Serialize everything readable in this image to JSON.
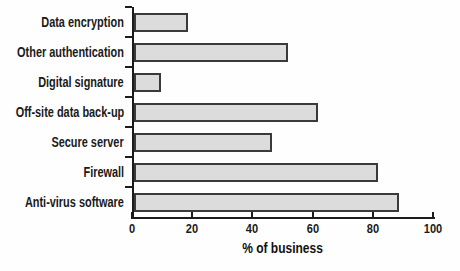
{
  "chart_data": {
    "type": "bar",
    "orientation": "horizontal",
    "title": "",
    "xlabel": "% of business",
    "ylabel": "",
    "categories": [
      "Data encryption",
      "Other authentication",
      "Digital signature",
      "Off-site data back-up",
      "Secure server",
      "Firewall",
      "Anti-virus software"
    ],
    "values": [
      18,
      51,
      9,
      61,
      46,
      81,
      88
    ],
    "xlim": [
      0,
      100
    ],
    "x_ticks": [
      0,
      20,
      40,
      60,
      80,
      100
    ],
    "grid": "off",
    "legend": "none",
    "bar_fill_color": "#dcdcdc",
    "bar_border_color": "#3a3a3a",
    "axis_color": "#1c1c1c",
    "text_color": "#1a1a1a",
    "background_color": "#fefefe"
  }
}
